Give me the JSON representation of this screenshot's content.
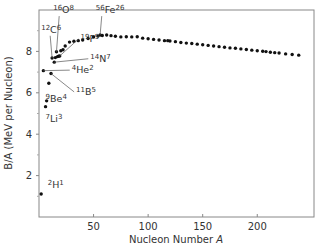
{
  "chart_data": {
    "type": "scatter",
    "title": "",
    "xlabel": "Nucleon Number A",
    "ylabel": "B/A (MeV per Nucleon)",
    "xlim": [
      0,
      252
    ],
    "ylim": [
      0,
      10
    ],
    "xticks": [
      50,
      100,
      150,
      200
    ],
    "yticks": [
      2,
      4,
      6,
      8
    ],
    "yminor_ticks": [
      1,
      3,
      5,
      7,
      9
    ],
    "grid": false,
    "legend": null,
    "points": [
      {
        "x": 2,
        "y": 1.11
      },
      {
        "x": 4,
        "y": 7.07
      },
      {
        "x": 6,
        "y": 5.33
      },
      {
        "x": 7,
        "y": 5.61
      },
      {
        "x": 9,
        "y": 6.46
      },
      {
        "x": 11,
        "y": 6.93
      },
      {
        "x": 12,
        "y": 7.68
      },
      {
        "x": 14,
        "y": 7.48
      },
      {
        "x": 15,
        "y": 7.7
      },
      {
        "x": 16,
        "y": 7.98
      },
      {
        "x": 17,
        "y": 7.75
      },
      {
        "x": 18,
        "y": 7.77
      },
      {
        "x": 19,
        "y": 7.78
      },
      {
        "x": 20,
        "y": 8.03
      },
      {
        "x": 22,
        "y": 8.08
      },
      {
        "x": 24,
        "y": 8.26
      },
      {
        "x": 28,
        "y": 8.45
      },
      {
        "x": 32,
        "y": 8.49
      },
      {
        "x": 36,
        "y": 8.52
      },
      {
        "x": 40,
        "y": 8.55
      },
      {
        "x": 45,
        "y": 8.62
      },
      {
        "x": 50,
        "y": 8.7
      },
      {
        "x": 54,
        "y": 8.74
      },
      {
        "x": 56,
        "y": 8.79
      },
      {
        "x": 58,
        "y": 8.77
      },
      {
        "x": 62,
        "y": 8.79
      },
      {
        "x": 66,
        "y": 8.76
      },
      {
        "x": 70,
        "y": 8.73
      },
      {
        "x": 75,
        "y": 8.7
      },
      {
        "x": 80,
        "y": 8.71
      },
      {
        "x": 85,
        "y": 8.7
      },
      {
        "x": 90,
        "y": 8.71
      },
      {
        "x": 95,
        "y": 8.64
      },
      {
        "x": 100,
        "y": 8.61
      },
      {
        "x": 105,
        "y": 8.58
      },
      {
        "x": 110,
        "y": 8.55
      },
      {
        "x": 115,
        "y": 8.52
      },
      {
        "x": 118,
        "y": 8.52
      },
      {
        "x": 120,
        "y": 8.5
      },
      {
        "x": 125,
        "y": 8.47
      },
      {
        "x": 130,
        "y": 8.43
      },
      {
        "x": 135,
        "y": 8.4
      },
      {
        "x": 140,
        "y": 8.38
      },
      {
        "x": 145,
        "y": 8.35
      },
      {
        "x": 150,
        "y": 8.32
      },
      {
        "x": 155,
        "y": 8.29
      },
      {
        "x": 160,
        "y": 8.26
      },
      {
        "x": 165,
        "y": 8.23
      },
      {
        "x": 170,
        "y": 8.2
      },
      {
        "x": 175,
        "y": 8.17
      },
      {
        "x": 180,
        "y": 8.15
      },
      {
        "x": 185,
        "y": 8.12
      },
      {
        "x": 190,
        "y": 8.09
      },
      {
        "x": 195,
        "y": 8.06
      },
      {
        "x": 200,
        "y": 8.03
      },
      {
        "x": 205,
        "y": 8.01
      },
      {
        "x": 208,
        "y": 7.99
      },
      {
        "x": 212,
        "y": 7.96
      },
      {
        "x": 216,
        "y": 7.94
      },
      {
        "x": 220,
        "y": 7.92
      },
      {
        "x": 226,
        "y": 7.88
      },
      {
        "x": 232,
        "y": 7.85
      },
      {
        "x": 238,
        "y": 7.82
      }
    ],
    "annotations": [
      {
        "id": "H2",
        "mass": "2",
        "symbol": "H",
        "z": "1",
        "label_x": 8,
        "label_y": 1.4,
        "point_x": 2,
        "point_y": 1.11,
        "leader": false
      },
      {
        "id": "Li7",
        "mass": "7",
        "symbol": "Li",
        "z": "3",
        "label_x": 6,
        "label_y": 4.6,
        "point_x": 7,
        "point_y": 5.61,
        "leader": false
      },
      {
        "id": "Be9",
        "mass": "9",
        "symbol": "Be",
        "z": "4",
        "label_x": 6,
        "label_y": 5.55,
        "point_x": 9,
        "point_y": 6.46,
        "leader": false
      },
      {
        "id": "B11",
        "mass": "11",
        "symbol": "B",
        "z": "5",
        "label_x": 34,
        "label_y": 5.9,
        "point_x": 11,
        "point_y": 6.93,
        "leader": true
      },
      {
        "id": "He4",
        "mass": "4",
        "symbol": "He",
        "z": "2",
        "label_x": 30,
        "label_y": 6.95,
        "point_x": 4,
        "point_y": 7.07,
        "leader": true
      },
      {
        "id": "N14",
        "mass": "14",
        "symbol": "N",
        "z": "7",
        "label_x": 47,
        "label_y": 7.5,
        "point_x": 14,
        "point_y": 7.48,
        "leader": true
      },
      {
        "id": "C12",
        "mass": "12",
        "symbol": "C",
        "z": "6",
        "label_x": 2,
        "label_y": 8.9,
        "point_x": 12,
        "point_y": 7.68,
        "leader": true
      },
      {
        "id": "F19",
        "mass": "19",
        "symbol": "F",
        "z": "9",
        "label_x": 38,
        "label_y": 8.45,
        "point_x": 19,
        "point_y": 7.78,
        "leader": true
      },
      {
        "id": "O16",
        "mass": "16",
        "symbol": "O",
        "z": "8",
        "label_x": 13,
        "label_y": 9.85,
        "point_x": 16,
        "point_y": 7.98,
        "leader": true
      },
      {
        "id": "Fe56",
        "mass": "56",
        "symbol": "Fe",
        "z": "26",
        "label_x": 52,
        "label_y": 9.85,
        "point_x": 56,
        "point_y": 8.79,
        "leader": true
      }
    ]
  }
}
